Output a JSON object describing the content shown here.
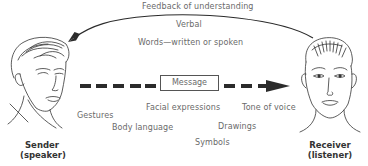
{
  "diagram": {
    "feedback_label": "Feedback of understanding",
    "verbal_label": "Verbal",
    "words_label": "Words—written or spoken",
    "message_label": "Message",
    "nonverbal_labels": {
      "gestures": "Gestures",
      "facial_expressions": "Facial expressions",
      "tone_of_voice": "Tone of voice",
      "body_language": "Body language",
      "drawings": "Drawings",
      "symbols": "Symbols"
    },
    "sender": {
      "line1": "Sender",
      "line2": "(speaker)"
    },
    "receiver": {
      "line1": "Receiver",
      "line2": "(listener)"
    },
    "colors": {
      "line": "#2b2b2b",
      "text": "#6a6a6a",
      "role_text": "#333333"
    }
  }
}
